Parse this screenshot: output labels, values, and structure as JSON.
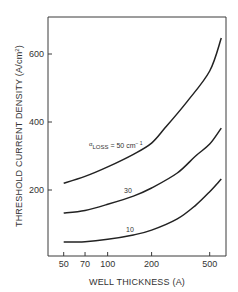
{
  "chart_data": {
    "type": "line",
    "title": "",
    "xlabel": "WELL THICKNESS (A)",
    "ylabel": "THRESHOLD CURRENT DENSITY (A/cm2)",
    "ylabel_main": "THRESHOLD CURRENT DENSITY (A/cm",
    "ylabel_sup": "2",
    "ylabel_close": ")",
    "x_scale": "log",
    "xlim": [
      40,
      600
    ],
    "ylim": [
      0,
      700
    ],
    "x_ticks": [
      50,
      70,
      100,
      200,
      500
    ],
    "x_tick_labels": [
      "50",
      "70",
      "100",
      "200",
      "500"
    ],
    "y_ticks": [
      200,
      400,
      600
    ],
    "y_tick_labels": [
      "200",
      "400",
      "600"
    ],
    "grid": false,
    "legend": "inline annotations",
    "series": [
      {
        "name": "αLOSS = 50 cm-1",
        "label_alpha": "α",
        "label_sub": "LOSS",
        "label_rest": " = 50 cm",
        "label_sup": "− 1",
        "x": [
          50,
          70,
          100,
          150,
          200,
          250,
          350,
          500,
          600
        ],
        "values": [
          220,
          240,
          268,
          305,
          338,
          385,
          460,
          550,
          647
        ]
      },
      {
        "name": "30",
        "label": "30",
        "x": [
          50,
          70,
          100,
          150,
          200,
          300,
          400,
          500,
          600
        ],
        "values": [
          132,
          140,
          158,
          182,
          206,
          250,
          300,
          335,
          382
        ]
      },
      {
        "name": "10",
        "label": "10",
        "x": [
          50,
          70,
          100,
          150,
          200,
          300,
          400,
          500,
          600
        ],
        "values": [
          47,
          48,
          55,
          68,
          82,
          115,
          155,
          195,
          232
        ]
      }
    ]
  }
}
